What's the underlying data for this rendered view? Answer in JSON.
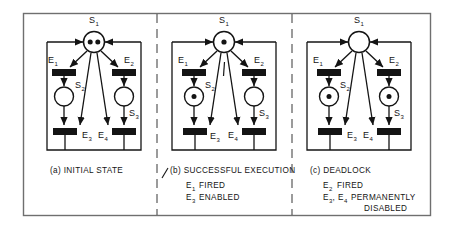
{
  "figure": {
    "kind": "petri-net-diagram",
    "title": "",
    "panel_divider_style": "dashed",
    "colors": {
      "ink": "#141414",
      "paper": "#ffffff",
      "frame": "#6f6f6f",
      "transition_fill": "#141414",
      "place_fill": "#ffffff",
      "token_fill": "#141414"
    },
    "panels": [
      {
        "id": "a",
        "caption_lines": [
          "(a) INITIAL STATE"
        ],
        "places": [
          {
            "name": "S1",
            "label": "S",
            "sub": "1",
            "tokens": 2
          },
          {
            "name": "S2",
            "label": "S",
            "sub": "2",
            "tokens": 0
          },
          {
            "name": "S3",
            "label": "S",
            "sub": "3",
            "tokens": 0
          }
        ],
        "transitions": [
          {
            "name": "E1",
            "label": "E",
            "sub": "1"
          },
          {
            "name": "E2",
            "label": "E",
            "sub": "2"
          },
          {
            "name": "E3",
            "label": "E",
            "sub": "3"
          },
          {
            "name": "E4",
            "label": "E",
            "sub": "4"
          }
        ]
      },
      {
        "id": "b",
        "caption_lines": [
          "(b) SUCCESSFUL EXECUTION"
        ],
        "status_lines": [
          {
            "label": "E",
            "sub": "1",
            "text": "FIRED"
          },
          {
            "label": "E",
            "sub": "3",
            "text": "ENABLED"
          }
        ],
        "places": [
          {
            "name": "S1",
            "label": "S",
            "sub": "1",
            "tokens": 1
          },
          {
            "name": "S2",
            "label": "S",
            "sub": "2",
            "tokens": 1
          },
          {
            "name": "S3",
            "label": "S",
            "sub": "3",
            "tokens": 0
          }
        ],
        "transitions": [
          {
            "name": "E1",
            "label": "E",
            "sub": "1"
          },
          {
            "name": "E2",
            "label": "E",
            "sub": "2"
          },
          {
            "name": "E3",
            "label": "E",
            "sub": "3"
          },
          {
            "name": "E4",
            "label": "E",
            "sub": "4"
          }
        ]
      },
      {
        "id": "c",
        "caption_lines": [
          "(c) DEADLOCK"
        ],
        "status_lines": [
          {
            "label": "E",
            "sub": "2",
            "text": "FIRED"
          },
          {
            "label": "E",
            "sub": "3",
            "text": "PERMANENTLY",
            "label2": "E",
            "sub2": "4",
            "continuation": "DISABLED"
          }
        ],
        "places": [
          {
            "name": "S1",
            "label": "S",
            "sub": "1",
            "tokens": 0
          },
          {
            "name": "S2",
            "label": "S",
            "sub": "2",
            "tokens": 1
          },
          {
            "name": "S3",
            "label": "S",
            "sub": "3",
            "tokens": 1
          }
        ],
        "transitions": [
          {
            "name": "E1",
            "label": "E",
            "sub": "1"
          },
          {
            "name": "E2",
            "label": "E",
            "sub": "2"
          },
          {
            "name": "E3",
            "label": "E",
            "sub": "3"
          },
          {
            "name": "E4",
            "label": "E",
            "sub": "4"
          }
        ]
      }
    ],
    "text": {
      "panel_a_caption": "(a) INITIAL STATE",
      "panel_b_caption": "(b) SUCCESSFUL EXECUTION",
      "panel_b_line1_text": "FIRED",
      "panel_b_line2_text": "ENABLED",
      "panel_c_caption": "(c) DEADLOCK",
      "panel_c_line1_text": "FIRED",
      "panel_c_line2_text": "PERMANENTLY",
      "panel_c_line3_text": "DISABLED",
      "comma": ",",
      "S": "S",
      "E": "E",
      "one": "1",
      "two": "2",
      "three": "3",
      "four": "4"
    }
  }
}
